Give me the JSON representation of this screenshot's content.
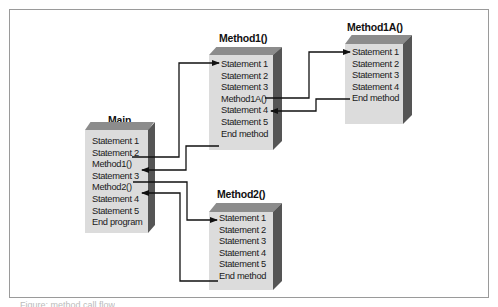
{
  "diagram": {
    "boxes": {
      "main": {
        "title": "Main",
        "rows": [
          "Statement 1",
          "Statement 2",
          "Method1()",
          "Statement 3",
          "Method2()",
          "Statement 4",
          "Statement 5",
          "End program"
        ]
      },
      "method1": {
        "title": "Method1()",
        "rows": [
          "Statement 1",
          "Statement 2",
          "Statement 3",
          "Method1A()",
          "Statement 4",
          "Statement 5",
          "End method"
        ]
      },
      "method1a": {
        "title": "Method1A()",
        "rows": [
          "Statement 1",
          "Statement 2",
          "Statement 3",
          "Statement 4",
          "End method"
        ]
      },
      "method2": {
        "title": "Method2()",
        "rows": [
          "Statement 1",
          "Statement 2",
          "Statement 3",
          "Statement 4",
          "Statement 5",
          "End method"
        ]
      }
    },
    "colors": {
      "front_face": "#dcdcdc",
      "top_face": "#8c8c8c",
      "side_face": "#555555",
      "lines": "#111111",
      "frame": "#9a9a9a"
    },
    "caption": "Figure: method call flow"
  }
}
